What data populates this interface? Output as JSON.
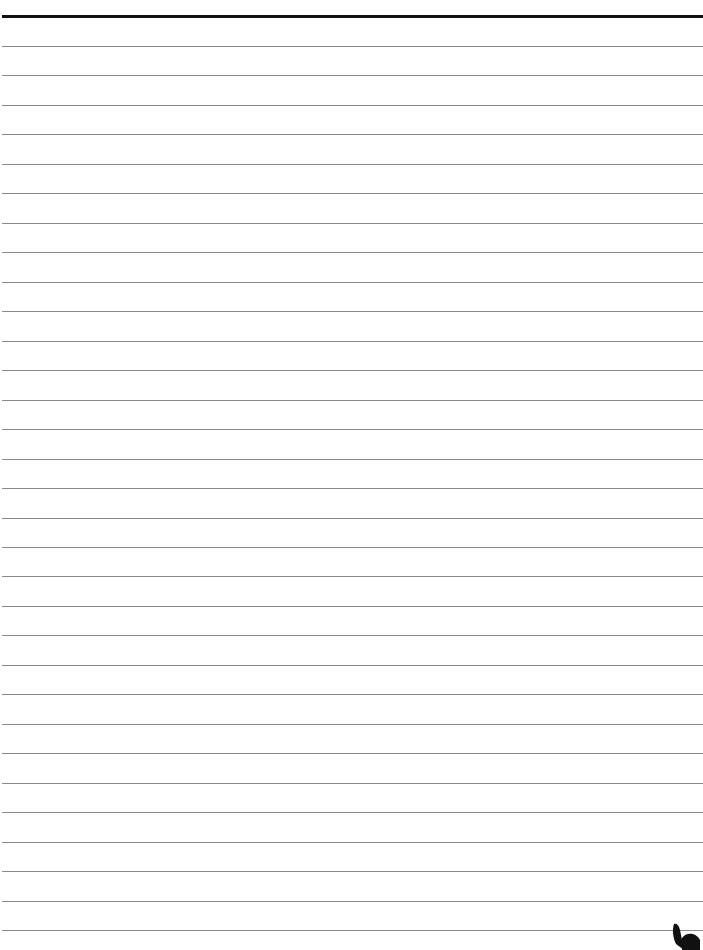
{
  "page": {
    "type": "lined-paper",
    "background_color": "#ffffff",
    "header_rule_color": "#111111",
    "line_color": "#8a8a8a",
    "line_count": 31,
    "first_line_y": 46,
    "line_spacing": 29.47
  },
  "decoration": {
    "corner_icon": "ink-blot-icon"
  }
}
